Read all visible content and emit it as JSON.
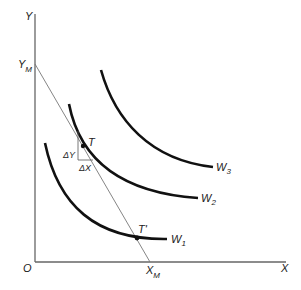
{
  "diagram": {
    "type": "indifference-curves-budget-line",
    "axes": {
      "y_label": "Y",
      "x_label": "X",
      "origin_label": "O"
    },
    "budget_line": {
      "y_intercept_label": "Y",
      "y_intercept_sub": "M",
      "x_intercept_label": "X",
      "x_intercept_sub": "M"
    },
    "curves": [
      {
        "label": "W",
        "sub": "1"
      },
      {
        "label": "W",
        "sub": "2"
      },
      {
        "label": "W",
        "sub": "3"
      }
    ],
    "points": {
      "t": "T",
      "t_prime": "T'"
    },
    "triangle": {
      "delta_y": "ΔY",
      "delta_x": "ΔX"
    },
    "colors": {
      "curve": "#111111",
      "axis": "#555555",
      "budget": "#666666"
    }
  }
}
